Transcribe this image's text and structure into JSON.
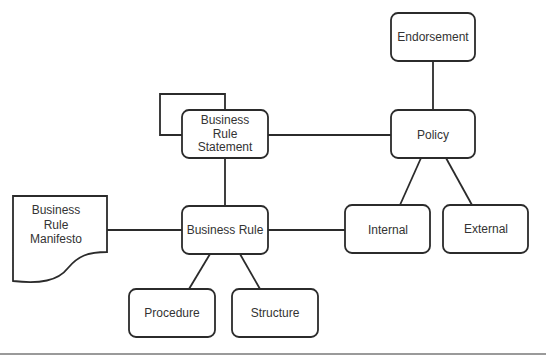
{
  "diagram": {
    "colors": {
      "stroke": "#2b2b2b",
      "text": "#333333",
      "background": "#ffffff",
      "divider": "#9a9a9a"
    },
    "nodes": {
      "business_rule_statement": {
        "lines": [
          "Business",
          "Rule",
          "Statement"
        ]
      },
      "endorsement": {
        "label": "Endorsement"
      },
      "policy": {
        "label": "Policy"
      },
      "business_rule": {
        "label": "Business Rule"
      },
      "business_rule_manifesto": {
        "lines": [
          "Business",
          "Rule",
          "Manifesto"
        ]
      },
      "procedure": {
        "label": "Procedure"
      },
      "structure": {
        "label": "Structure"
      },
      "internal": {
        "label": "Internal"
      },
      "external": {
        "label": "External"
      }
    },
    "edges": [
      {
        "from": "business_rule_statement",
        "to": "business_rule_statement",
        "kind": "self-loop"
      },
      {
        "from": "business_rule_statement",
        "to": "policy"
      },
      {
        "from": "business_rule_statement",
        "to": "business_rule"
      },
      {
        "from": "endorsement",
        "to": "policy"
      },
      {
        "from": "policy",
        "to": "internal"
      },
      {
        "from": "policy",
        "to": "external"
      },
      {
        "from": "business_rule_manifesto",
        "to": "business_rule"
      },
      {
        "from": "business_rule",
        "to": "internal"
      },
      {
        "from": "business_rule",
        "to": "procedure"
      },
      {
        "from": "business_rule",
        "to": "structure"
      }
    ]
  }
}
